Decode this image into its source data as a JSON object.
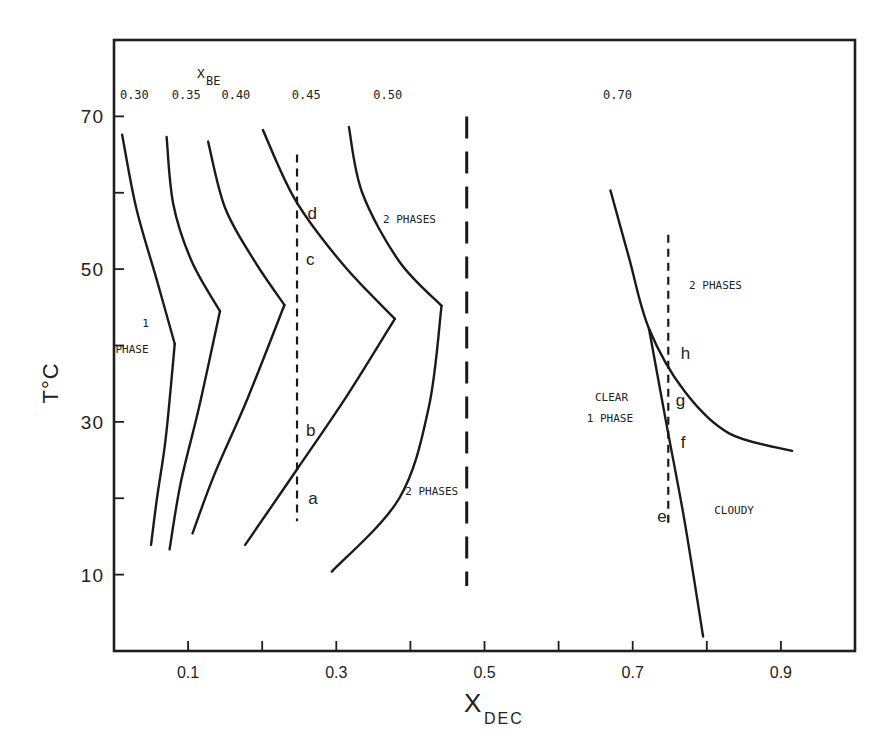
{
  "chart_data": {
    "type": "line",
    "title": "",
    "xlabel": "X",
    "xlabel_subscript": "DEC",
    "ylabel": "T°C",
    "xlim": [
      0,
      1.0
    ],
    "ylim": [
      0,
      80
    ],
    "grid": false,
    "legend": null,
    "x_ticks": [
      0.1,
      0.2,
      0.3,
      0.4,
      0.5,
      0.6,
      0.7,
      0.8,
      0.9
    ],
    "x_tick_labels": [
      {
        "value": 0.1,
        "label": "0.1"
      },
      {
        "value": 0.3,
        "label": "0.3"
      },
      {
        "value": 0.5,
        "label": "0.5"
      },
      {
        "value": 0.7,
        "label": "0.7"
      },
      {
        "value": 0.9,
        "label": "0.9"
      }
    ],
    "y_ticks": [
      10,
      20,
      30,
      40,
      50,
      60,
      70
    ],
    "y_tick_labels": [
      {
        "value": 70,
        "label": "70"
      },
      {
        "value": 50,
        "label": "50"
      },
      {
        "value": 30,
        "label": "30"
      },
      {
        "value": 10,
        "label": "10"
      }
    ],
    "series_group_label": "X",
    "series_group_label_subscript": "BE",
    "series": [
      {
        "name": "0.30",
        "label_pos": [
          0.008,
          72.3
        ],
        "points": [
          [
            0.011,
            67.6
          ],
          [
            0.03,
            58.0
          ],
          [
            0.058,
            48.5
          ],
          [
            0.082,
            40.2
          ],
          [
            0.07,
            28.0
          ],
          [
            0.058,
            20.0
          ],
          [
            0.05,
            13.9
          ]
        ]
      },
      {
        "name": "0.35",
        "label_pos": [
          0.078,
          72.3
        ],
        "points": [
          [
            0.071,
            67.3
          ],
          [
            0.08,
            58.5
          ],
          [
            0.105,
            51.0
          ],
          [
            0.143,
            44.5
          ],
          [
            0.115,
            32.0
          ],
          [
            0.09,
            22.0
          ],
          [
            0.075,
            13.3
          ]
        ]
      },
      {
        "name": "0.40",
        "label_pos": [
          0.145,
          72.3
        ],
        "points": [
          [
            0.127,
            66.7
          ],
          [
            0.15,
            58.0
          ],
          [
            0.19,
            51.0
          ],
          [
            0.23,
            45.3
          ],
          [
            0.18,
            33.0
          ],
          [
            0.135,
            23.0
          ],
          [
            0.106,
            15.4
          ]
        ]
      },
      {
        "name": "0.45",
        "label_pos": [
          0.24,
          72.3
        ],
        "points": [
          [
            0.201,
            68.2
          ],
          [
            0.245,
            59.0
          ],
          [
            0.31,
            50.5
          ],
          [
            0.379,
            43.5
          ],
          [
            0.315,
            33.5
          ],
          [
            0.245,
            23.5
          ],
          [
            0.177,
            13.9
          ]
        ]
      },
      {
        "name": "0.50",
        "label_pos": [
          0.35,
          72.3
        ],
        "points": [
          [
            0.317,
            68.6
          ],
          [
            0.335,
            60.0
          ],
          [
            0.385,
            51.0
          ],
          [
            0.442,
            45.2
          ],
          [
            0.425,
            32.0
          ],
          [
            0.385,
            20.0
          ],
          [
            0.294,
            10.4
          ]
        ]
      },
      {
        "name": "0.70",
        "label_pos": [
          0.66,
          72.3
        ],
        "points_upper": [
          [
            0.67,
            60.3
          ],
          [
            0.695,
            51.5
          ],
          [
            0.722,
            42.2
          ],
          [
            0.77,
            34.0
          ],
          [
            0.83,
            28.5
          ],
          [
            0.915,
            26.2
          ]
        ],
        "points_lower": [
          [
            0.722,
            42.2
          ],
          [
            0.745,
            30.0
          ],
          [
            0.77,
            17.0
          ],
          [
            0.795,
            1.9
          ]
        ]
      }
    ],
    "reference_lines": [
      {
        "style": "short-dash",
        "x": 0.247,
        "y_range": [
          17.0,
          65.0
        ]
      },
      {
        "style": "long-dash",
        "x": 0.476,
        "y_range": [
          8.5,
          70.0
        ]
      },
      {
        "style": "short-dash",
        "x": 0.748,
        "y_range": [
          16.0,
          54.5
        ]
      }
    ],
    "point_labels": [
      {
        "label": "d",
        "x": 0.261,
        "y": 57.4
      },
      {
        "label": "c",
        "x": 0.259,
        "y": 51.3
      },
      {
        "label": "b",
        "x": 0.259,
        "y": 29.0
      },
      {
        "label": "a",
        "x": 0.262,
        "y": 20.0
      },
      {
        "label": "h",
        "x": 0.765,
        "y": 39.0
      },
      {
        "label": "g",
        "x": 0.758,
        "y": 32.8
      },
      {
        "label": "f",
        "x": 0.765,
        "y": 27.4
      },
      {
        "label": "e",
        "x": 0.733,
        "y": 17.7
      }
    ],
    "annotations": [
      {
        "text": "1",
        "x": 0.038,
        "y": 42.9
      },
      {
        "text": "PHASE",
        "x": 0.002,
        "y": 39.5
      },
      {
        "text": "2 PHASES",
        "x": 0.363,
        "y": 56.5
      },
      {
        "text": "2 PHASES",
        "x": 0.393,
        "y": 21.0
      },
      {
        "text": "2 PHASES",
        "x": 0.776,
        "y": 47.9
      },
      {
        "text": "CLEAR",
        "x": 0.649,
        "y": 33.3
      },
      {
        "text": "1 PHASE",
        "x": 0.638,
        "y": 30.5
      },
      {
        "text": "CLOUDY",
        "x": 0.81,
        "y": 18.5
      }
    ]
  }
}
